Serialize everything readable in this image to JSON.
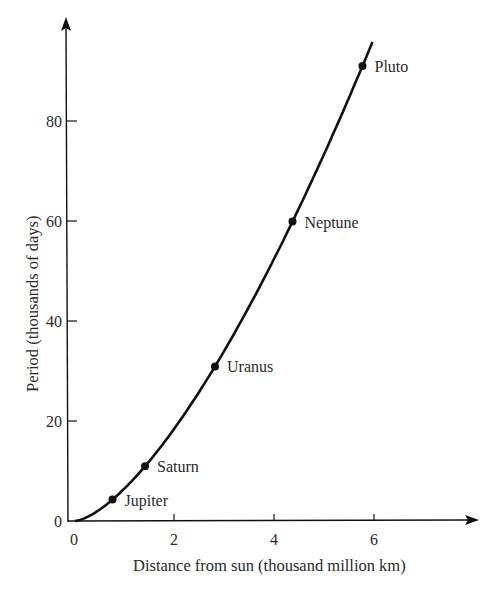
{
  "chart_data": {
    "type": "line",
    "title": "",
    "xlabel": "Distance from sun (thousand million km)",
    "ylabel": "Period (thousands of days)",
    "xlim": [
      0,
      8
    ],
    "ylim": [
      0,
      100
    ],
    "x_ticks": [
      "0",
      "2",
      "4",
      "6"
    ],
    "y_ticks": [
      "0",
      "20",
      "40",
      "60",
      "80"
    ],
    "grid": false,
    "legend": null,
    "series": [
      {
        "name": "Planets",
        "points": [
          {
            "label": "Jupiter",
            "x": 0.75,
            "y": 4
          },
          {
            "label": "Saturn",
            "x": 1.4,
            "y": 11
          },
          {
            "label": "Uranus",
            "x": 2.8,
            "y": 31
          },
          {
            "label": "Neptune",
            "x": 4.35,
            "y": 61
          },
          {
            "label": "Pluto",
            "x": 5.75,
            "y": 91
          }
        ]
      }
    ]
  },
  "colors": {
    "ink": "#111111",
    "text": "#2a2a2a",
    "background": "#ffffff"
  }
}
